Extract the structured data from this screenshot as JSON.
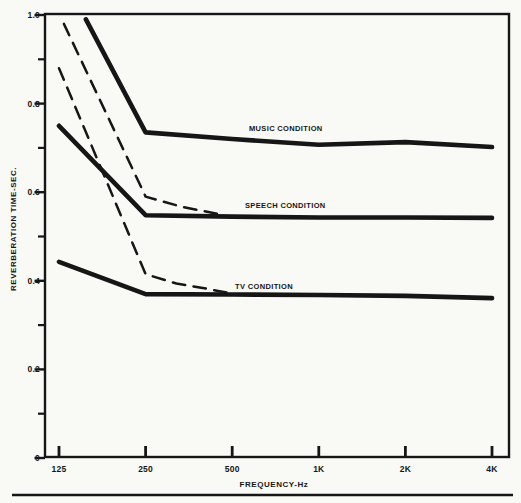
{
  "figure": {
    "background": "#f9f9f6",
    "ink": "#161616"
  },
  "chart_data": {
    "type": "line",
    "title": "",
    "xlabel": "FREQUENCY-Hz",
    "ylabel": "REVERBERATION TIME-SEC.",
    "x_scale": "log2",
    "xlim": [
      108,
      4400
    ],
    "ylim": [
      0,
      1.0
    ],
    "grid": "off",
    "legend": "inline-annotations",
    "x_ticks": [
      {
        "f": 125,
        "label": "125"
      },
      {
        "f": 250,
        "label": "250"
      },
      {
        "f": 500,
        "label": "500"
      },
      {
        "f": 1000,
        "label": "1K"
      },
      {
        "f": 2000,
        "label": "2K"
      },
      {
        "f": 4000,
        "label": "4K"
      }
    ],
    "y_ticks": [
      {
        "v": 0,
        "label": "0"
      },
      {
        "v": 0.2,
        "label": "0.2"
      },
      {
        "v": 0.4,
        "label": "0.4"
      },
      {
        "v": 0.6,
        "label": "0.6"
      },
      {
        "v": 0.8,
        "label": "0.8"
      },
      {
        "v": 1.0,
        "label": "1.0"
      }
    ],
    "y_minor_ticks": [
      0.1,
      0.3,
      0.5,
      0.7,
      0.9
    ],
    "series": [
      {
        "name": "music-condition-solid",
        "condition": "MUSIC CONDITION",
        "style": "solid",
        "stroke_width": 4.6,
        "points": [
          [
            155,
            0.99
          ],
          [
            250,
            0.735
          ],
          [
            500,
            0.72
          ],
          [
            1000,
            0.707
          ],
          [
            2000,
            0.713
          ],
          [
            4000,
            0.702
          ]
        ]
      },
      {
        "name": "speech-condition-solid",
        "condition": "SPEECH CONDITION",
        "style": "solid",
        "stroke_width": 4.6,
        "points": [
          [
            125,
            0.75
          ],
          [
            250,
            0.548
          ],
          [
            500,
            0.545
          ],
          [
            1000,
            0.543
          ],
          [
            2000,
            0.543
          ],
          [
            4000,
            0.542
          ]
        ]
      },
      {
        "name": "tv-condition-solid",
        "condition": "TV CONDITION",
        "style": "solid",
        "stroke_width": 4.6,
        "points": [
          [
            125,
            0.443
          ],
          [
            250,
            0.37
          ],
          [
            500,
            0.369
          ],
          [
            1000,
            0.368
          ],
          [
            2000,
            0.366
          ],
          [
            4000,
            0.361
          ]
        ]
      },
      {
        "name": "speech-condition-dashed",
        "condition": "SPEECH CONDITION",
        "style": "dashed",
        "stroke_width": 2.5,
        "points": [
          [
            130,
            0.98
          ],
          [
            250,
            0.59
          ],
          [
            330,
            0.568
          ],
          [
            460,
            0.549
          ]
        ]
      },
      {
        "name": "tv-condition-dashed",
        "condition": "TV CONDITION",
        "style": "dashed",
        "stroke_width": 2.5,
        "points": [
          [
            125,
            0.88
          ],
          [
            250,
            0.415
          ],
          [
            320,
            0.394
          ],
          [
            400,
            0.383
          ],
          [
            500,
            0.371
          ]
        ]
      }
    ],
    "annotations": [
      {
        "text": "MUSIC CONDITION",
        "x_px": 249,
        "y_px": 131
      },
      {
        "text": "SPEECH CONDITION",
        "x_px": 245,
        "y_px": 208
      },
      {
        "text": "TV CONDITION",
        "x_px": 235,
        "y_px": 289
      }
    ]
  }
}
